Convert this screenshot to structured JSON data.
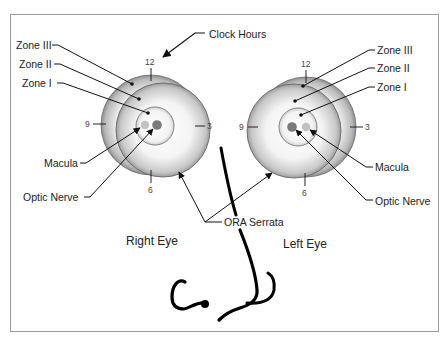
{
  "figure": {
    "callouts": {
      "clock_hours": "Clock Hours",
      "ora_serrata": "ORA Serrata"
    },
    "right_eye": {
      "title": "Right Eye",
      "labels": {
        "zone3": "Zone III",
        "zone2": "Zone II",
        "zone1": "Zone I",
        "macula": "Macula",
        "optic_nerve": "Optic Nerve"
      },
      "clock": {
        "top": "12",
        "right": "3",
        "bottom": "6",
        "left": "9"
      }
    },
    "left_eye": {
      "title": "Left Eye",
      "labels": {
        "zone3": "Zone III",
        "zone2": "Zone II",
        "zone1": "Zone I",
        "macula": "Macula",
        "optic_nerve": "Optic Nerve"
      },
      "clock": {
        "top": "12",
        "right": "3",
        "bottom": "6",
        "left": "9"
      }
    },
    "colors": {
      "frame": "#9a9a9a",
      "line": "#111111",
      "macula": "#bdbdbd",
      "optic_nerve": "#7a7a7a"
    }
  }
}
